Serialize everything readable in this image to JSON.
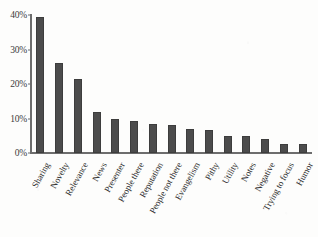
{
  "chart_data": {
    "type": "bar",
    "title": "",
    "subtitle": "",
    "xlabel": "",
    "ylabel": "",
    "ylim": [
      0,
      40
    ],
    "yticks": [
      0,
      10,
      20,
      30,
      40
    ],
    "ytick_labels": [
      "0%",
      "10%",
      "20%",
      "30%",
      "40%"
    ],
    "grid": false,
    "legend": "none",
    "bar_color": "#4c4c4c",
    "axis_color": "#6d6d6d",
    "background_color": "#fdfdfc",
    "categories": [
      "Sharing",
      "Novelty",
      "Relevance",
      "News",
      "Presenter",
      "People there",
      "Reputation",
      "People not there",
      "Evangelism",
      "Pithy",
      "Utility",
      "Notes",
      "Negative",
      "Trying to focus",
      "Humor"
    ],
    "values": [
      39.5,
      26,
      21.5,
      12,
      10,
      9.2,
      8.5,
      8,
      7,
      6.7,
      5,
      5,
      4.2,
      2.5,
      2.5
    ],
    "value_unit": "%"
  }
}
